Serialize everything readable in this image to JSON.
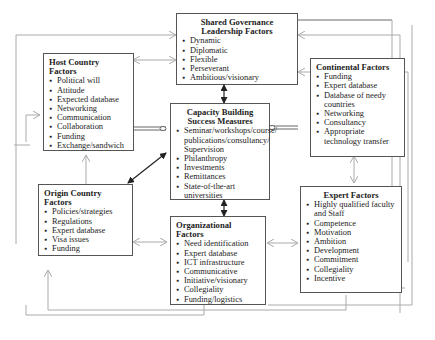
{
  "diagram": {
    "boxes": {
      "shared_governance": {
        "title": "Shared Governance Leadership Factors",
        "items": [
          "Dynamic",
          "Diplomatic",
          "Flexible",
          "Perseverant",
          "Ambitious/visionary"
        ]
      },
      "host_country": {
        "title": "Host Country Factors",
        "items": [
          "Political will",
          "Attitude",
          "Expected database",
          "Networking",
          "Communication",
          "Collaboration",
          "Funding",
          "Exchange/sandwich"
        ]
      },
      "continental": {
        "title": "Continental Factors",
        "items": [
          "Funding",
          "Expert database",
          "Database of needy countries",
          "Networking",
          "Consultancy",
          "Appropriate technology transfer"
        ]
      },
      "capacity_building": {
        "title": "Capacity Building Success Measures",
        "items": [
          "Seminar/workshops/course/ publications/consultancy/ Supervision",
          "Philanthropy",
          "Investments",
          "Remittances",
          "State-of-the-art universities"
        ]
      },
      "origin_country": {
        "title": "Origin Country Factors",
        "items": [
          "Policies/strategies",
          "Regulations",
          "Expert database",
          "Visa issues",
          "Funding"
        ]
      },
      "organizational": {
        "title": "Organizational Factors",
        "items": [
          "Need identification",
          "Expert database",
          "ICT infrastructure",
          "Communicative",
          "Initiative/visionary",
          "Collegiality",
          "Funding/logistics"
        ]
      },
      "expert": {
        "title": "Expert Factors",
        "items": [
          "Highly qualified faculty and Staff",
          "Competence",
          "Motivation",
          "Ambition",
          "Development",
          "Commitment",
          "Collegiality",
          "Incentive"
        ]
      }
    },
    "colors": {
      "box_border": "#555555",
      "strong_arrow": "#222222",
      "feedback_line": "#aaaaaa"
    }
  }
}
